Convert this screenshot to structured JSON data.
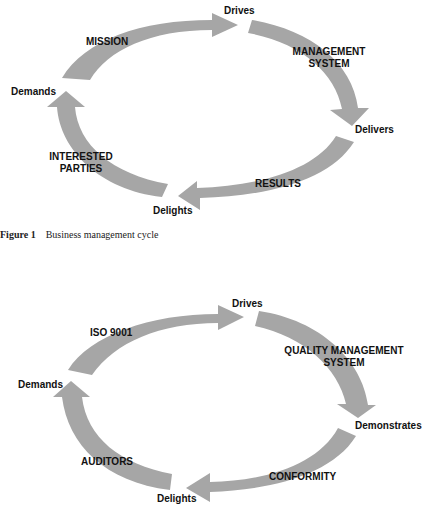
{
  "colors": {
    "arrow": "#a6a6a6",
    "text": "#111111",
    "background": "#ffffff"
  },
  "figure1": {
    "nodes": {
      "top": "Drives",
      "right": "Delivers",
      "bottom": "Delights",
      "left": "Demands"
    },
    "arrows": {
      "top_left": "MISSION",
      "top_right_line1": "MANAGEMENT",
      "top_right_line2": "SYSTEM",
      "bottom_right": "RESULTS",
      "bottom_left_line1": "INTERESTED",
      "bottom_left_line2": "PARTIES"
    },
    "caption": {
      "number": "Figure 1",
      "text": "Business management cycle"
    }
  },
  "figure2": {
    "nodes": {
      "top": "Drives",
      "right": "Demonstrates",
      "bottom": "Delights",
      "left": "Demands"
    },
    "arrows": {
      "top_left": "ISO 9001",
      "top_right_line1": "QUALITY MANAGEMENT",
      "top_right_line2": "SYSTEM",
      "bottom_right": "CONFORMITY",
      "bottom_left": "AUDITORS"
    }
  }
}
